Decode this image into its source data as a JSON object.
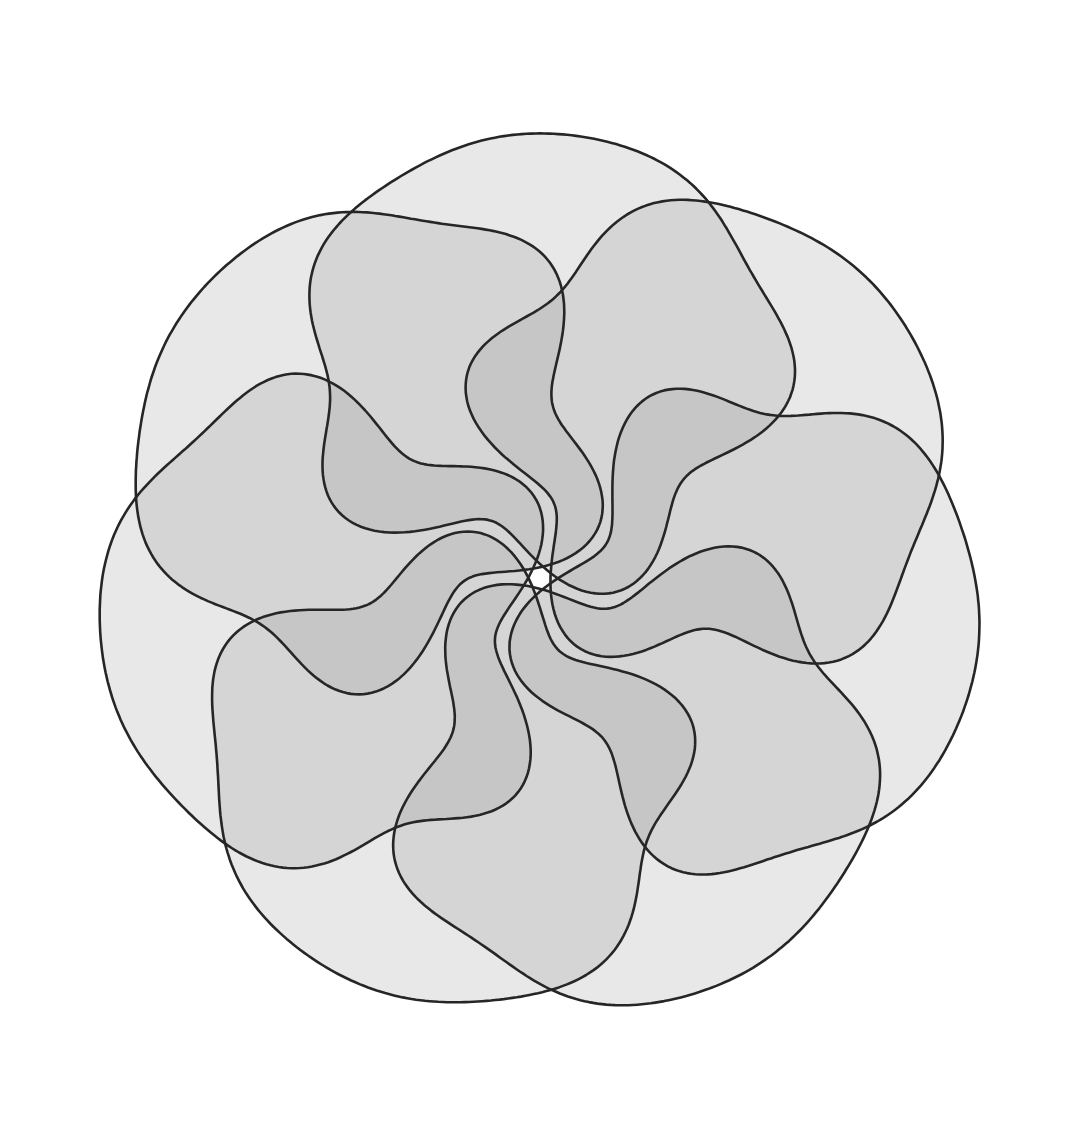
{
  "diagram": {
    "type": "venn",
    "title": "",
    "set_count": 7,
    "symmetry": "7-fold rotational",
    "canvas": {
      "width": 1088,
      "height": 1135,
      "background": "#ffffff"
    },
    "center": {
      "x": 540,
      "y": 578
    },
    "colors": {
      "outline": "#262626",
      "set_fill": "#8a8a8a",
      "set_fill_opacity": 0.2
    },
    "shape": {
      "outer_radius": 300,
      "offset": 205,
      "inner_wave_amplitude": 42,
      "inner_wave_count": 5,
      "start_angle_deg": -90
    },
    "sets": [
      {
        "id": "set-1",
        "label": ""
      },
      {
        "id": "set-2",
        "label": ""
      },
      {
        "id": "set-3",
        "label": ""
      },
      {
        "id": "set-4",
        "label": ""
      },
      {
        "id": "set-5",
        "label": ""
      },
      {
        "id": "set-6",
        "label": ""
      },
      {
        "id": "set-7",
        "label": ""
      }
    ]
  }
}
